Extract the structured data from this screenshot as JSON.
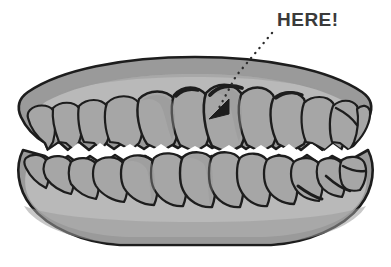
{
  "image": {
    "title": "Dental arches illustration with HERE annotation",
    "width": 391,
    "height": 267,
    "background_color": "#ffffff",
    "style": "grayscale line illustration"
  },
  "annotation": {
    "label": "HERE!",
    "label_color": "#3a3a3a",
    "label_x": 277,
    "label_y": 10,
    "leader_line": {
      "kind": "dotted",
      "color": "#2b2b2b",
      "dot_size": 2.2,
      "points": [
        [
          272,
          33
        ],
        [
          235,
          75
        ],
        [
          217,
          110
        ]
      ]
    },
    "arrowhead": {
      "color": "#1d1d1d",
      "tip_x": 210,
      "tip_y": 118,
      "points": "210,118 228,100 228,113"
    },
    "points_at": "upper-left-central-incisor"
  },
  "colors": {
    "outline": "#1d1d1d",
    "gum_dark": "#9a9a9a",
    "gum_light": "#b9b9b9",
    "tooth": "#a6a6a6",
    "tooth_shadow": "#979797",
    "gap_white": "#ffffff",
    "label": "#3a3a3a"
  },
  "anatomy": {
    "upper_arch": {
      "name": "upper-dental-arch",
      "teeth_count": 12,
      "gum_bands": [
        "gum-dark-upper",
        "gum-light-upper"
      ]
    },
    "lower_arch": {
      "name": "lower-dental-arch",
      "teeth_count": 12,
      "gum_bands": [
        "gum-light-lower",
        "gum-dark-lower"
      ]
    },
    "occlusal_gap": {
      "name": "occlusal-gap",
      "color": "#ffffff",
      "shape": "zigzag"
    }
  }
}
